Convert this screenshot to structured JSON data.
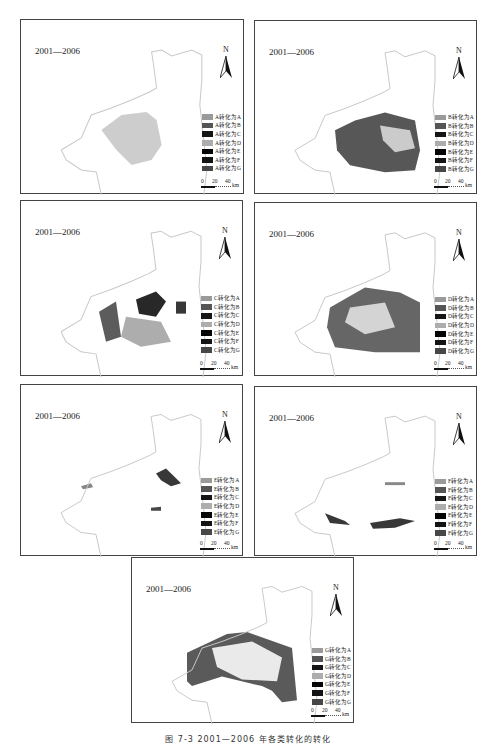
{
  "figure": {
    "caption": "图 7-3  2001—2006 年各类转化的转化"
  },
  "common": {
    "period": "2001—2006",
    "north_label": "N",
    "scale": {
      "ticks": [
        "0",
        "20",
        "40"
      ],
      "unit": "km"
    }
  },
  "swatch_colors": {
    "A": "#9a9a9a",
    "B": "#555555",
    "C": "#151515",
    "D": "#adadad",
    "E": "#050505",
    "F": "#141414",
    "G": "#474747"
  },
  "panels": [
    {
      "id": "A",
      "legend": [
        "A转化为A",
        "A转化为B",
        "A转化为C",
        "A转化为D",
        "A转化为E",
        "A转化为F",
        "A转化为G"
      ]
    },
    {
      "id": "B",
      "legend": [
        "B转化为A",
        "B转化为B",
        "B转化为C",
        "B转化为D",
        "B转化为E",
        "B转化为F",
        "B转化为G"
      ]
    },
    {
      "id": "C",
      "legend": [
        "C转化为A",
        "C转化为B",
        "C转化为C",
        "C转化为D",
        "C转化为E",
        "C转化为F",
        "C转化为G"
      ]
    },
    {
      "id": "D",
      "legend": [
        "D转化为A",
        "D转化为B",
        "D转化为C",
        "D转化为D",
        "D转化为E",
        "D转化为F",
        "D转化为G"
      ]
    },
    {
      "id": "E",
      "legend": [
        "E转化为A",
        "E转化为B",
        "E转化为C",
        "E转化为D",
        "E转化为E",
        "E转化为F",
        "E转化为G"
      ]
    },
    {
      "id": "F",
      "legend": [
        "F转化为A",
        "F转化为B",
        "F转化为C",
        "F转化为D",
        "F转化为E",
        "F转化为F",
        "F转化为G"
      ]
    },
    {
      "id": "G",
      "legend": [
        "G转化为A",
        "G转化为B",
        "G转化为C",
        "G转化为D",
        "G转化为E",
        "G转化为F",
        "G转化为G"
      ]
    }
  ]
}
